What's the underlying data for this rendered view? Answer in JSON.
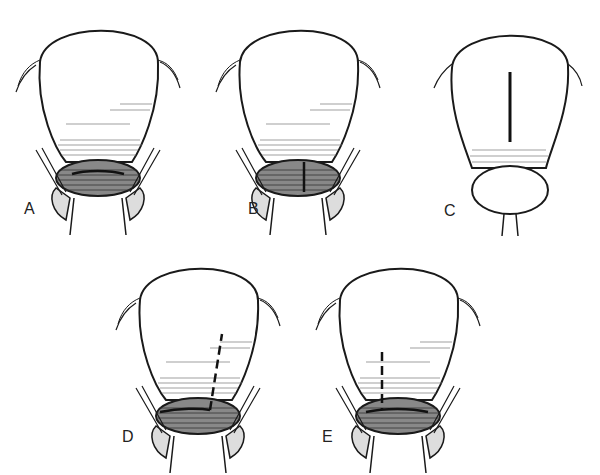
{
  "figure": {
    "panels": [
      {
        "id": "A",
        "label": "A",
        "incision": "low-transverse"
      },
      {
        "id": "B",
        "label": "B",
        "incision": "low-vertical"
      },
      {
        "id": "C",
        "label": "C",
        "incision": "classical-vertical"
      },
      {
        "id": "D",
        "label": "D",
        "incision": "J-extension"
      },
      {
        "id": "E",
        "label": "E",
        "incision": "T-extension"
      }
    ],
    "colors": {
      "line": "#1a1a1a",
      "hatch": "#555555",
      "background": "#ffffff"
    }
  }
}
